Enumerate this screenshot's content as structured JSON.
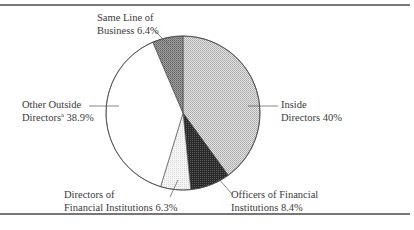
{
  "chart_data": {
    "type": "pie",
    "title": "",
    "start_angle_deg": 0,
    "direction": "clockwise",
    "slices": [
      {
        "name": "Inside Directors",
        "value": 40.0,
        "label_line1": "Inside",
        "label_line2": "Directors 40%",
        "fill": "#cfcfcf",
        "pattern": "light-dots"
      },
      {
        "name": "Officers of Financial Institutions",
        "value": 8.4,
        "label_line1": "Officers of Financial",
        "label_line2": "Institutions 8.4%",
        "fill": "#3a3a3a",
        "pattern": "dark-dots"
      },
      {
        "name": "Directors of Financial Institutions",
        "value": 6.3,
        "label_line1": "Directors of",
        "label_line2": "Financial Institutions 6.3%",
        "fill": "#f0f0f0",
        "pattern": "very-light-dots"
      },
      {
        "name": "Other Outside Directors",
        "value": 38.9,
        "label_line1": "Other Outside",
        "label_line2_prefix": "Directors",
        "label_line2_sup": "a",
        "label_line2_suffix": " 38.9%",
        "fill": "#ffffff",
        "pattern": "none"
      },
      {
        "name": "Same Line of Business",
        "value": 6.4,
        "label_line1": "Same Line of",
        "label_line2": "Business 6.4%",
        "fill": "#9a9a9a",
        "pattern": "medium-dots"
      }
    ],
    "legend": "none (direct labels with leader lines)"
  },
  "colors": {
    "rule": "#777777",
    "outline": "#444444",
    "text": "#3a3a3a"
  }
}
